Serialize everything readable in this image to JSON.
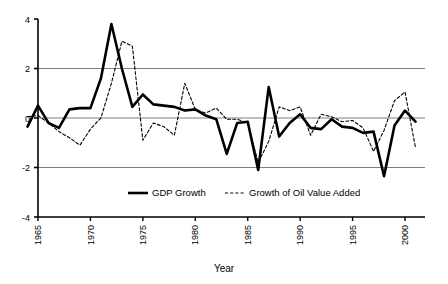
{
  "chart_data": {
    "type": "line",
    "title": "",
    "xlabel": "Year",
    "ylabel": "",
    "xlim": [
      1964,
      2001
    ],
    "ylim": [
      -4,
      4
    ],
    "grid": true,
    "gridlines_y": [
      2,
      0,
      -2
    ],
    "legend_position": "inside-bottom-center",
    "y_ticks": [
      "4",
      "2",
      "0",
      "-2",
      "-4"
    ],
    "y_tick_values": [
      4,
      2,
      0,
      -2,
      -4
    ],
    "x_ticks": [
      "1965",
      "1970",
      "1975",
      "1980",
      "1985",
      "1990",
      "1995",
      "2000"
    ],
    "x_tick_values": [
      1965,
      1970,
      1975,
      1980,
      1985,
      1990,
      1995,
      2000
    ],
    "x": [
      1964,
      1965,
      1966,
      1967,
      1968,
      1969,
      1970,
      1971,
      1972,
      1973,
      1974,
      1975,
      1976,
      1977,
      1978,
      1979,
      1980,
      1981,
      1982,
      1983,
      1984,
      1985,
      1986,
      1987,
      1988,
      1989,
      1990,
      1991,
      1992,
      1993,
      1994,
      1995,
      1996,
      1997,
      1998,
      1999,
      2000,
      2001
    ],
    "series": [
      {
        "name": "GDP Growth",
        "style": "solid",
        "color": "#000000",
        "width": 2.6,
        "values": [
          -0.35,
          0.5,
          -0.2,
          -0.4,
          0.35,
          0.4,
          0.4,
          1.6,
          3.8,
          2.0,
          0.45,
          0.95,
          0.55,
          0.5,
          0.45,
          0.3,
          0.35,
          0.1,
          -0.05,
          -1.45,
          -0.2,
          -0.15,
          -2.1,
          1.25,
          -0.75,
          -0.2,
          0.15,
          -0.4,
          -0.45,
          -0.05,
          -0.35,
          -0.4,
          -0.6,
          -0.55,
          -2.35,
          -0.3,
          0.3,
          -0.15
        ]
      },
      {
        "name": "Growth of Oil Value Added",
        "style": "dashed",
        "color": "#000000",
        "width": 1.1,
        "values": [
          0.05,
          0.1,
          -0.2,
          -0.55,
          -0.8,
          -1.1,
          -0.45,
          0.0,
          1.4,
          3.1,
          2.9,
          -0.9,
          -0.2,
          -0.35,
          -0.7,
          1.4,
          0.35,
          0.2,
          0.4,
          -0.05,
          -0.05,
          -0.2,
          -1.8,
          -0.95,
          0.45,
          0.3,
          0.45,
          -0.7,
          0.15,
          0.05,
          -0.15,
          -0.1,
          -0.4,
          -1.35,
          -0.5,
          0.7,
          1.05,
          -1.2
        ]
      }
    ]
  },
  "legend": {
    "items": [
      {
        "label": "GDP Growth",
        "style": "solid"
      },
      {
        "label": "Growth of Oil Value Added",
        "style": "dashed"
      }
    ]
  },
  "axis": {
    "x_title": "Year"
  },
  "colors": {
    "axis": "#000000",
    "gridline": "#808080",
    "background": "#ffffff"
  }
}
